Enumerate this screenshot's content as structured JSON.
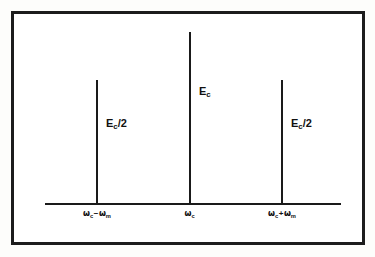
{
  "figure": {
    "name": "am-modulation-frequency-spectrum",
    "frame_color": "#1c1c1c",
    "line_color": "#1a1a1a",
    "background_color": "#ffffff"
  },
  "axis": {
    "name": "frequency-axis",
    "orientation": "horizontal",
    "label": ""
  },
  "amplitudes": {
    "lower_sideband": {
      "base": "E",
      "sub": "c",
      "suffix": "/2",
      "text": "Ec/2"
    },
    "carrier": {
      "base": "E",
      "sub": "c",
      "suffix": "",
      "text": "Ec"
    },
    "upper_sideband": {
      "base": "E",
      "sub": "c",
      "suffix": "/2",
      "text": "Ec/2"
    }
  },
  "frequencies": {
    "lower_sideband": {
      "omega1": "ω",
      "sub1": "c",
      "operator": "−",
      "omega2": "ω",
      "sub2": "m",
      "text": "ωc − ωm"
    },
    "carrier": {
      "omega1": "ω",
      "sub1": "c",
      "operator": "",
      "omega2": "",
      "sub2": "",
      "text": "ωc"
    },
    "upper_sideband": {
      "omega1": "ω",
      "sub1": "c",
      "operator": "+",
      "omega2": "ω",
      "sub2": "m",
      "text": "ωc + ωm"
    }
  },
  "chart_data": {
    "type": "bar",
    "title": "",
    "xlabel": "",
    "ylabel": "",
    "categories": [
      "ωc − ωm",
      "ωc",
      "ωc + ωm"
    ],
    "value_labels": [
      "Ec/2",
      "Ec",
      "Ec/2"
    ],
    "values": [
      0.5,
      1.0,
      0.5
    ],
    "ylim": [
      0,
      1.0
    ],
    "grid": false,
    "legend": null,
    "annotations": [
      {
        "at": "ωc − ωm",
        "text": "Ec/2"
      },
      {
        "at": "ωc",
        "text": "Ec"
      },
      {
        "at": "ωc + ωm",
        "text": "Ec/2"
      }
    ]
  }
}
